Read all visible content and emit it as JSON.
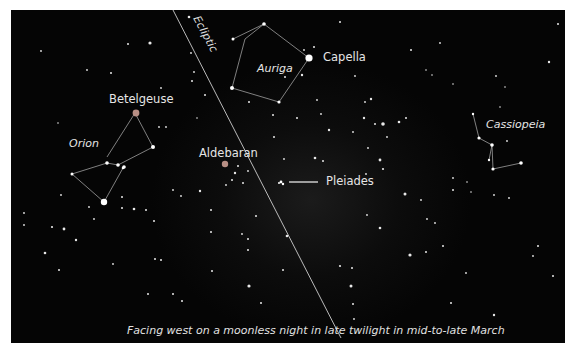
{
  "map": {
    "title": "Western evening sky star chart",
    "caption": "Facing west on a moonless night in late twilight in mid-to-late March",
    "ecliptic_label": "Ecliptic",
    "constellations": [
      {
        "name": "Orion",
        "label": "Orion"
      },
      {
        "name": "Auriga",
        "label": "Auriga"
      },
      {
        "name": "Cassiopeia",
        "label": "Cassiopeia"
      }
    ],
    "stars": [
      {
        "name": "Betelgeuse",
        "label": "Betelgeuse",
        "color": "#c9a9a0"
      },
      {
        "name": "Aldebaran",
        "label": "Aldebaran",
        "color": "#c9a9a0"
      },
      {
        "name": "Capella",
        "label": "Capella",
        "color": "#ffffff"
      }
    ],
    "clusters": [
      {
        "name": "Pleiades",
        "label": "Pleiades"
      }
    ],
    "colors": {
      "sky": "#050505",
      "lines": "#bfbfbf",
      "text": "#e6e6e6",
      "frame": "#ffffff"
    }
  }
}
